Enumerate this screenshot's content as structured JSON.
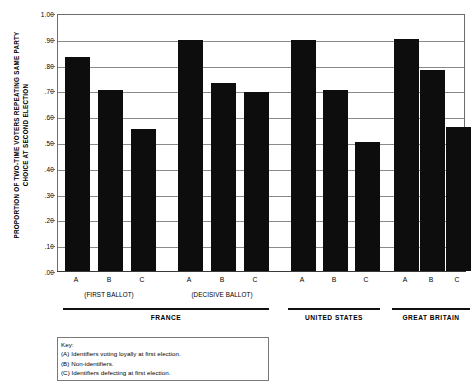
{
  "chart_data": {
    "type": "bar",
    "title": "",
    "subtitle": "",
    "xlabel": "",
    "ylabel": "PROPORTION OF TWO-TIME VOTERS REPEATING SAME PARTY\nCHOICE AT SECOND ELECTION",
    "ylim": [
      0.0,
      1.0
    ],
    "grid": true,
    "legend_position": "bottom-left-box",
    "ytick_labels": [
      "1.00",
      ".90",
      ".80",
      ".70",
      ".60",
      ".50",
      ".40",
      ".30",
      ".20",
      ".10",
      ".00"
    ],
    "ytick_values": [
      1.0,
      0.9,
      0.8,
      0.7,
      0.6,
      0.5,
      0.4,
      0.3,
      0.2,
      0.1,
      0.0
    ],
    "categories": [
      "A",
      "B",
      "C",
      "A",
      "B",
      "C",
      "A",
      "B",
      "C",
      "A",
      "B",
      "C"
    ],
    "values": [
      0.83,
      0.7,
      0.55,
      0.895,
      0.73,
      0.695,
      0.895,
      0.7,
      0.5,
      0.9,
      0.78,
      0.56
    ],
    "bars": [
      {
        "label": "A",
        "value": 0.83,
        "group": "FRANCE",
        "subgroup": "(FIRST BALLOT)"
      },
      {
        "label": "B",
        "value": 0.7,
        "group": "FRANCE",
        "subgroup": "(FIRST BALLOT)"
      },
      {
        "label": "C",
        "value": 0.55,
        "group": "FRANCE",
        "subgroup": "(FIRST BALLOT)"
      },
      {
        "label": "A",
        "value": 0.895,
        "group": "FRANCE",
        "subgroup": "(DECISIVE BALLOT)"
      },
      {
        "label": "B",
        "value": 0.73,
        "group": "FRANCE",
        "subgroup": "(DECISIVE BALLOT)"
      },
      {
        "label": "C",
        "value": 0.695,
        "group": "FRANCE",
        "subgroup": "(DECISIVE BALLOT)"
      },
      {
        "label": "A",
        "value": 0.895,
        "group": "UNITED STATES",
        "subgroup": ""
      },
      {
        "label": "B",
        "value": 0.7,
        "group": "UNITED STATES",
        "subgroup": ""
      },
      {
        "label": "C",
        "value": 0.5,
        "group": "UNITED STATES",
        "subgroup": ""
      },
      {
        "label": "A",
        "value": 0.9,
        "group": "GREAT BRITAIN",
        "subgroup": ""
      },
      {
        "label": "B",
        "value": 0.78,
        "group": "GREAT BRITAIN",
        "subgroup": ""
      },
      {
        "label": "C",
        "value": 0.56,
        "group": "GREAT BRITAIN",
        "subgroup": ""
      }
    ],
    "subgroups": [
      {
        "label": "(FIRST BALLOT)"
      },
      {
        "label": "(DECISIVE BALLOT)"
      }
    ],
    "groups": [
      {
        "label": "FRANCE"
      },
      {
        "label": "UNITED STATES"
      },
      {
        "label": "GREAT BRITAIN"
      }
    ],
    "series": [
      {
        "name": "Proportion repeating same party choice",
        "values": [
          0.83,
          0.7,
          0.55,
          0.895,
          0.73,
          0.695,
          0.895,
          0.7,
          0.5,
          0.9,
          0.78,
          0.56
        ]
      }
    ],
    "bar_color": "#0d0d0d"
  },
  "key": {
    "title": "Key:",
    "lines": [
      "(A) Identifiers voting loyally at first election.",
      "(B) Non-identifiers.",
      "(C) Identifiers defecting at first election."
    ]
  }
}
